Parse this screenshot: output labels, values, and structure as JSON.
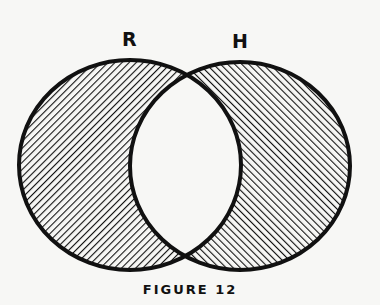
{
  "diagram": {
    "type": "venn",
    "sets": [
      {
        "label": "R",
        "shaded": "only-R (excluding intersection)",
        "hatch": "backslash"
      },
      {
        "label": "H",
        "shaded": "only-H (excluding intersection)",
        "hatch": "forward-slash"
      }
    ],
    "intersection_shaded": false,
    "caption": "FIGURE 12"
  },
  "colors": {
    "ink": "#111111",
    "background": "#f7f7f5"
  }
}
